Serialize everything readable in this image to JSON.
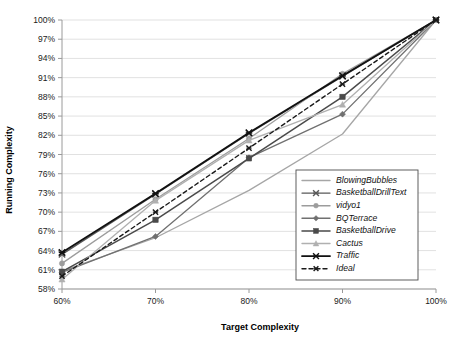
{
  "chart_data": {
    "type": "line",
    "title": "",
    "xlabel": "Target Complexity",
    "ylabel": "Running Complexity",
    "x": [
      60,
      70,
      80,
      90,
      100
    ],
    "xtick_labels": [
      "60%",
      "70%",
      "80%",
      "90%",
      "100%"
    ],
    "ytick_labels": [
      "58%",
      "61%",
      "64%",
      "67%",
      "70%",
      "73%",
      "76%",
      "79%",
      "82%",
      "85%",
      "88%",
      "91%",
      "94%",
      "97%",
      "100%"
    ],
    "yticks": [
      58,
      61,
      64,
      67,
      70,
      73,
      76,
      79,
      82,
      85,
      88,
      91,
      94,
      97,
      100
    ],
    "xlim": [
      60,
      100
    ],
    "ylim": [
      58,
      100
    ],
    "grid": true,
    "legend_position": "lower-right-inside",
    "series": [
      {
        "name": "BlowingBubbles",
        "values": [
          60.8,
          66.0,
          73.4,
          82.2,
          100.0
        ],
        "color": "#a6a6a6",
        "marker": "none",
        "dash": "none",
        "width": 1.3
      },
      {
        "name": "BasketballDrillText",
        "values": [
          63.4,
          72.8,
          82.3,
          91.2,
          100.0
        ],
        "color": "#595959",
        "marker": "cross",
        "dash": "none",
        "width": 1.3
      },
      {
        "name": "vidyo1",
        "values": [
          62.0,
          72.0,
          81.5,
          91.6,
          100.0
        ],
        "color": "#9c9c9c",
        "marker": "circle",
        "dash": "none",
        "width": 1.3
      },
      {
        "name": "BQTerrace",
        "values": [
          60.6,
          66.2,
          78.5,
          85.3,
          100.0
        ],
        "color": "#707070",
        "marker": "diamond",
        "dash": "none",
        "width": 1.3
      },
      {
        "name": "BasketballDrive",
        "values": [
          60.7,
          68.8,
          78.4,
          88.0,
          100.0
        ],
        "color": "#4a4a4a",
        "marker": "square",
        "dash": "none",
        "width": 1.5
      },
      {
        "name": "Cactus",
        "values": [
          59.5,
          71.8,
          81.2,
          86.8,
          100.0
        ],
        "color": "#b0b0b0",
        "marker": "triangle",
        "dash": "none",
        "width": 1.3
      },
      {
        "name": "Traffic",
        "values": [
          63.7,
          72.9,
          82.4,
          91.3,
          100.0
        ],
        "color": "#111111",
        "marker": "cross",
        "dash": "none",
        "width": 1.9
      },
      {
        "name": "Ideal",
        "values": [
          60.0,
          70.0,
          80.0,
          90.0,
          100.0
        ],
        "color": "#1a1a1a",
        "marker": "cross-small",
        "dash": "4,3",
        "width": 1.4
      }
    ]
  },
  "legend": {
    "entries": [
      "BlowingBubbles",
      "BasketballDrillText",
      "vidyo1",
      "BQTerrace",
      "BasketballDrive",
      "Cactus",
      "Traffic",
      "Ideal"
    ]
  }
}
